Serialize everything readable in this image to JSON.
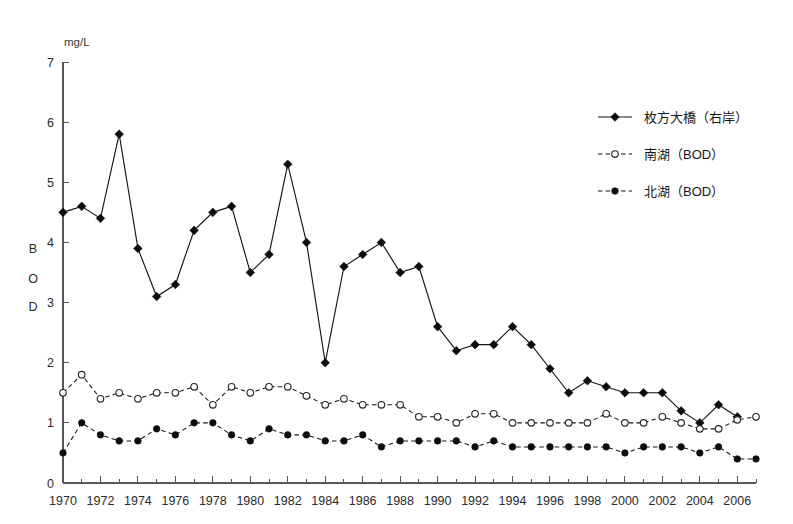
{
  "chart_data": {
    "type": "line",
    "title": "",
    "xlabel": "",
    "ylabel": "BOD",
    "unit_label": "mg/L",
    "ylim": [
      0,
      7
    ],
    "xlim": [
      1970,
      2007
    ],
    "grid": false,
    "legend_position": "right-top",
    "y_ticks": [
      0,
      1,
      2,
      3,
      4,
      5,
      6,
      7
    ],
    "y_tick_labels": [
      "0",
      "1",
      "2",
      "3",
      "4",
      "5",
      "6",
      "7"
    ],
    "x_ticks": [
      1970,
      1971,
      1972,
      1973,
      1974,
      1975,
      1976,
      1977,
      1978,
      1979,
      1980,
      1981,
      1982,
      1983,
      1984,
      1985,
      1986,
      1987,
      1988,
      1989,
      1990,
      1991,
      1992,
      1993,
      1994,
      1995,
      1996,
      1997,
      1998,
      1999,
      2000,
      2001,
      2002,
      2003,
      2004,
      2005,
      2006,
      2007
    ],
    "x_tick_labels": [
      "1970",
      "1972",
      "1974",
      "1976",
      "1978",
      "1980",
      "1982",
      "1984",
      "1986",
      "1988",
      "1990",
      "1992",
      "1994",
      "1996",
      "1998",
      "2000",
      "2002",
      "2004",
      "2006"
    ],
    "x_labelled_ticks": [
      1970,
      1972,
      1974,
      1976,
      1978,
      1980,
      1982,
      1984,
      1986,
      1988,
      1990,
      1992,
      1994,
      1996,
      1998,
      2000,
      2002,
      2004,
      2006
    ],
    "ylabel_chars": [
      "B",
      "O",
      "D"
    ],
    "x": [
      1970,
      1971,
      1972,
      1973,
      1974,
      1975,
      1976,
      1977,
      1978,
      1979,
      1980,
      1981,
      1982,
      1983,
      1984,
      1985,
      1986,
      1987,
      1988,
      1989,
      1990,
      1991,
      1992,
      1993,
      1994,
      1995,
      1996,
      1997,
      1998,
      1999,
      2000,
      2001,
      2002,
      2003,
      2004,
      2005,
      2006,
      2007
    ],
    "series": [
      {
        "name": "枚方大橋（右岸）",
        "marker": "filled-diamond",
        "linestyle": "solid",
        "color": "#0d0d0d",
        "values": [
          4.5,
          4.6,
          4.4,
          5.8,
          3.9,
          3.1,
          3.3,
          4.2,
          4.5,
          4.6,
          3.5,
          3.8,
          5.3,
          4.0,
          2.0,
          3.6,
          3.8,
          4.0,
          3.5,
          3.6,
          2.6,
          2.2,
          2.3,
          2.3,
          2.6,
          2.3,
          1.9,
          1.5,
          1.7,
          1.6,
          1.5,
          1.5,
          1.5,
          1.2,
          1.0,
          1.3,
          1.1,
          null
        ]
      },
      {
        "name": "南湖（BOD）",
        "marker": "open-circle",
        "linestyle": "dashed",
        "color": "#2a2a2a",
        "values": [
          1.5,
          1.8,
          1.4,
          1.5,
          1.4,
          1.5,
          1.5,
          1.6,
          1.3,
          1.6,
          1.5,
          1.6,
          1.6,
          1.45,
          1.3,
          1.4,
          1.3,
          1.3,
          1.3,
          1.1,
          1.1,
          1.0,
          1.15,
          1.15,
          1.0,
          1.0,
          1.0,
          1.0,
          1.0,
          1.15,
          1.0,
          1.0,
          1.1,
          1.0,
          0.9,
          0.9,
          1.05,
          1.1
        ]
      },
      {
        "name": "北湖（BOD）",
        "marker": "filled-circle",
        "linestyle": "dashed",
        "color": "#0d0d0d",
        "values": [
          0.5,
          1.0,
          0.8,
          0.7,
          0.7,
          0.9,
          0.8,
          1.0,
          1.0,
          0.8,
          0.7,
          0.9,
          0.8,
          0.8,
          0.7,
          0.7,
          0.8,
          0.6,
          0.7,
          0.7,
          0.7,
          0.7,
          0.6,
          0.7,
          0.6,
          0.6,
          0.6,
          0.6,
          0.6,
          0.6,
          0.5,
          0.6,
          0.6,
          0.6,
          0.5,
          0.6,
          0.4,
          0.4
        ]
      }
    ]
  },
  "legend": {
    "items": [
      {
        "label": "枚方大橋（右岸）",
        "marker": "filled-diamond",
        "linestyle": "solid"
      },
      {
        "label": "南湖（BOD）",
        "marker": "open-circle",
        "linestyle": "dashed"
      },
      {
        "label": "北湖（BOD）",
        "marker": "filled-circle",
        "linestyle": "dashed"
      }
    ]
  }
}
